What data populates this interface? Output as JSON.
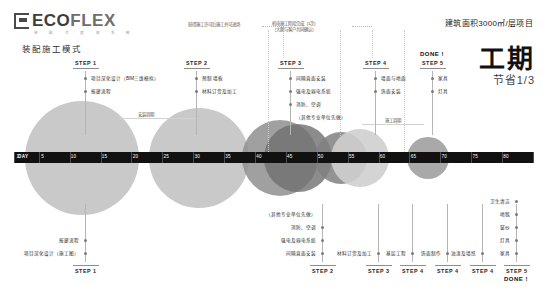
{
  "brand": {
    "name_eco": "ECO",
    "name_flex": "FLEX",
    "tagline": "装 配 式 建 筑 系 统",
    "subtitle": "装配施工模式"
  },
  "header": {
    "area_note": "建筑面积3000㎡/层项目",
    "headline_main": "工期",
    "headline_sub": "节省1/3"
  },
  "axis": {
    "day_label": "DAY",
    "ticks": [
      1,
      5,
      10,
      15,
      20,
      25,
      30,
      35,
      40,
      45,
      50,
      55,
      60,
      65,
      70,
      75,
      80,
      85
    ],
    "bar_color": "#111111"
  },
  "top_notes": [
    {
      "id": "note-interior-start",
      "text": "获得施工许可后施工并可进场",
      "x": 188,
      "y": 22
    },
    {
      "id": "note-mech-complete",
      "text": "机电施工阶段完成（1次）\n（大题与客户共同确认）",
      "line1": "机电施工阶段完成（1次）",
      "line2": "（大题与客户共同确认）",
      "x": 272,
      "y": 21
    },
    {
      "id": "note-mid-span",
      "text": "安装周期",
      "x": 138,
      "y": 112
    },
    {
      "id": "note-site-construction",
      "text": "施工周期",
      "x": 385,
      "y": 118
    }
  ],
  "steps_top": [
    {
      "id": "step-1",
      "label": "STEP 1",
      "x": 85,
      "items": [
        "项目深化设计（BIM三维模拟）",
        "报建流程"
      ]
    },
    {
      "id": "step-2",
      "label": "STEP 2",
      "x": 196,
      "items": [
        "预制 墙板",
        "材料订货及加工"
      ]
    },
    {
      "id": "step-3",
      "label": "STEP 3",
      "x": 290,
      "items": [
        "间隔直面安装",
        "强电及弱电系统",
        "消防、空调",
        "（其他专业单位先做）"
      ]
    },
    {
      "id": "step-4",
      "label": "STEP 4",
      "x": 375,
      "items": [
        "墙面与地面",
        "饰面安装"
      ]
    },
    {
      "id": "step-5",
      "label": "STEP 5",
      "done": "DONE !",
      "x": 432,
      "items": [
        "家具",
        "灯具"
      ]
    }
  ],
  "steps_bottom": [
    {
      "id": "step-1-bottom",
      "label": "STEP 1",
      "x": 85,
      "items": [
        "项目深化设计（施工图）",
        "报建流程"
      ]
    },
    {
      "id": "step-2-bottom",
      "label": "STEP 2",
      "x": 322,
      "items": [
        "间隔直面安装",
        "强电及弱电系统",
        "消防、空调",
        "（其他专业单位先做）"
      ]
    },
    {
      "id": "step-3-bottom",
      "label": "STEP 3",
      "x": 378,
      "items": [
        "材料订货及加工"
      ]
    },
    {
      "id": "step-4a-bottom",
      "label": "STEP 4",
      "x": 412,
      "items": [
        "基层工程"
      ]
    },
    {
      "id": "step-4b-bottom",
      "label": "STEP 4",
      "x": 447,
      "items": [
        "饰面制作"
      ]
    },
    {
      "id": "step-4c-bottom",
      "label": "STEP 4",
      "x": 482,
      "items": [
        "油漆及墙纸"
      ]
    },
    {
      "id": "step-5-bottom",
      "label": "STEP 5",
      "done": "DONE !",
      "x": 516,
      "items": [
        "家具",
        "灯具",
        "窗纱",
        "地毯",
        "卫生清洁"
      ]
    }
  ],
  "chart_data": {
    "type": "bubble",
    "title": "装配施工模式",
    "xlabel": "DAY",
    "xlim": [
      1,
      85
    ],
    "bubbles": [
      {
        "id": "b1",
        "center_day": 12,
        "radius_px": 57,
        "color": "#c6c6c6",
        "opacity": 0.95
      },
      {
        "id": "b2",
        "center_day": 31,
        "radius_px": 50,
        "color": "#c6c6c6",
        "opacity": 0.95
      },
      {
        "id": "b3",
        "center_day": 44,
        "radius_px": 38,
        "color": "#8f8f8f",
        "opacity": 0.85
      },
      {
        "id": "b4",
        "center_day": 47,
        "radius_px": 34,
        "color": "#6f6f6f",
        "opacity": 0.8
      },
      {
        "id": "b5",
        "center_day": 54,
        "radius_px": 26,
        "color": "#808080",
        "opacity": 0.85
      },
      {
        "id": "b6",
        "center_day": 57,
        "radius_px": 29,
        "color": "#cfcfcf",
        "opacity": 0.9
      },
      {
        "id": "b7",
        "center_day": 68,
        "radius_px": 21,
        "color": "#9a9a9a",
        "opacity": 0.85
      }
    ]
  }
}
